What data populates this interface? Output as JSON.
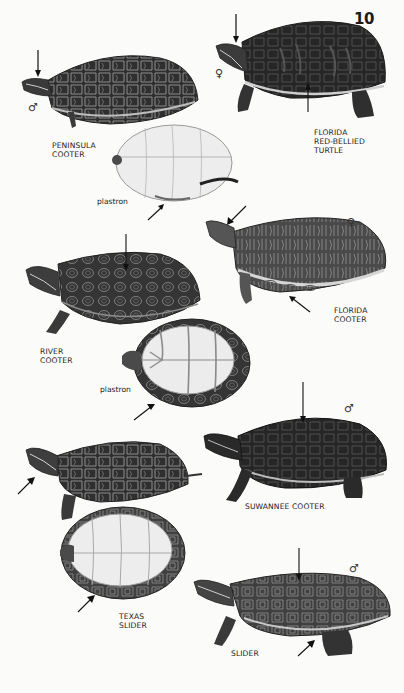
{
  "page": {
    "number": "10"
  },
  "figures": [
    {
      "id": "peninsula-cooter",
      "name_lines": [
        "PENINSULA",
        "COOTER"
      ],
      "sex_symbol": "♂",
      "views": [
        "carapace",
        "plastron"
      ],
      "plastron_label": "plastron"
    },
    {
      "id": "florida-red-bellied-turtle",
      "name_lines": [
        "FLORIDA",
        "RED-BELLIED",
        "TURTLE"
      ],
      "sex_symbol": "♀",
      "views": [
        "carapace"
      ]
    },
    {
      "id": "florida-cooter",
      "name_lines": [
        "FLORIDA",
        "COOTER"
      ],
      "sex_symbol": "♀",
      "views": [
        "carapace"
      ]
    },
    {
      "id": "river-cooter",
      "name_lines": [
        "RIVER",
        "COOTER"
      ],
      "views": [
        "carapace",
        "plastron"
      ],
      "plastron_label": "plastron"
    },
    {
      "id": "suwannee-cooter",
      "name_lines": [
        "SUWANNEE COOTER"
      ],
      "sex_symbol": "♂",
      "views": [
        "carapace"
      ]
    },
    {
      "id": "texas-slider",
      "name_lines": [
        "TEXAS",
        "SLIDER"
      ],
      "views": [
        "carapace",
        "plastron"
      ]
    },
    {
      "id": "slider",
      "name_lines": [
        "SLIDER"
      ],
      "sex_symbol": "♂",
      "views": [
        "carapace"
      ]
    }
  ],
  "colors": {
    "background": "#fbfbfa",
    "shell_dark": "#2b2b2b",
    "shell_mid": "#4a4a4a",
    "pattern_light": "#9a9a9a",
    "plastron": "#ececec",
    "ink": "#1a1a1a"
  }
}
